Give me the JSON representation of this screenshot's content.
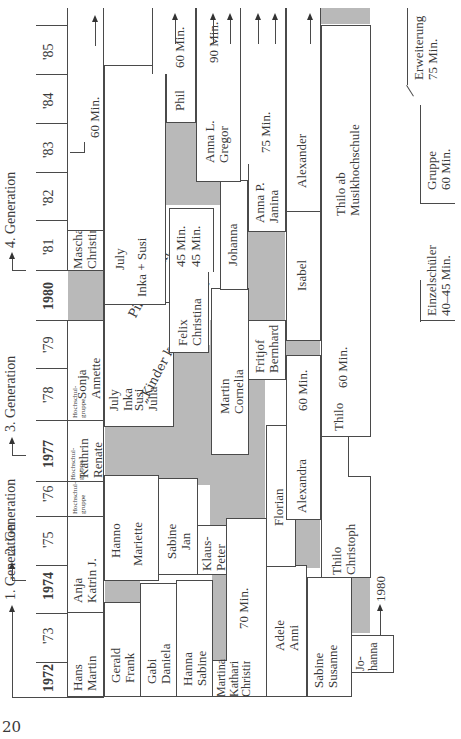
{
  "page_number": "20",
  "generations": [
    {
      "label": "1. Generation"
    },
    {
      "label": "2. Generation"
    },
    {
      "label": "3. Generation"
    },
    {
      "label": "4. Generation"
    }
  ],
  "years": [
    "1972",
    "'73",
    "1974",
    "'75",
    "'76",
    "1977",
    "'78",
    "'79",
    "1980",
    "'81",
    "'82",
    "'83",
    "'84",
    "'85"
  ],
  "groups": {
    "hans_martin": "Hans\nMartin",
    "anja_katrin": "Anja\nKatrin J.",
    "hochschul_1": "Hochschul-\ngruppe",
    "kathrin_renate": "Kathrin\nRenate",
    "hochschul_2": "Hochschul-\ngruppe",
    "sonja_annette": "Sonja\nAnnette",
    "hochschul_3": "Hochschul-\ngruppe",
    "mascha_christina": "Mascha\nChristina",
    "min_60_top": "60 Min.",
    "gerald_frank": "Gerald\nFrank",
    "hanno": "Hanno",
    "mariette": "Mariette",
    "july_inka_1": "July\nInka",
    "susi_julia": "Susi\nJulia",
    "pilotprojekt": "Pilotprojekt",
    "kinder_komponieren": "„Kinder komponieren“",
    "july_2": "July",
    "inka_susi": "Inka + Susi",
    "gabi_daniela": "Gabi\nDaniela",
    "sabine_jan": "Sabine\nJan",
    "felix_christina": "Felix\nChristina",
    "min_45_a": "45 Min.",
    "min_45_b": "45 Min.",
    "phil": "Phil",
    "min_60_phil": "60 Min.",
    "hanna_sabine": "Hanna\nSabine",
    "klaus_peter": "Klaus-\nPeter",
    "martin_cornelia": "Martin\nCornelia",
    "johanna": "Johanna",
    "anna_l_gregor": "Anna L.\nGregor",
    "min_90": "90 Min.",
    "martina_katharina_christina": "Martina\nKatharina\nChristina",
    "min_70": "70 Min.",
    "fritjof_bernhard": "Fritjof\nBernhard",
    "anna_p_janina": "Anna P.\nJanina",
    "min_75": "75 Min.",
    "adele_anni": "Adele\nAnni",
    "florian": "Florian",
    "alexandra": "Alexandra",
    "min_60_alex": "60 Min.",
    "isabel": "Isabel",
    "alexander": "Alexander",
    "sabine_susanne": "Sabine\nSusanne",
    "thilo_christoph": "Thilo\nChristoph",
    "thilo": "Thilo",
    "min_60_thilo": "60 Min.",
    "thilo_musikhochschule": "Thilo ab\nMusikhochschule",
    "johanna_2": "Jo-\nhanna",
    "to_1980": "1980"
  },
  "legend": {
    "erweiterung": "Erweiterung\n75 Min.",
    "gruppe": "Gruppe\n60 Min.",
    "einzelschueler": "Einzelschüler\n40–45 Min."
  },
  "colors": {
    "shade": "#b9b9b9",
    "line": "#4a4a4a",
    "text": "#3a3a3a"
  }
}
